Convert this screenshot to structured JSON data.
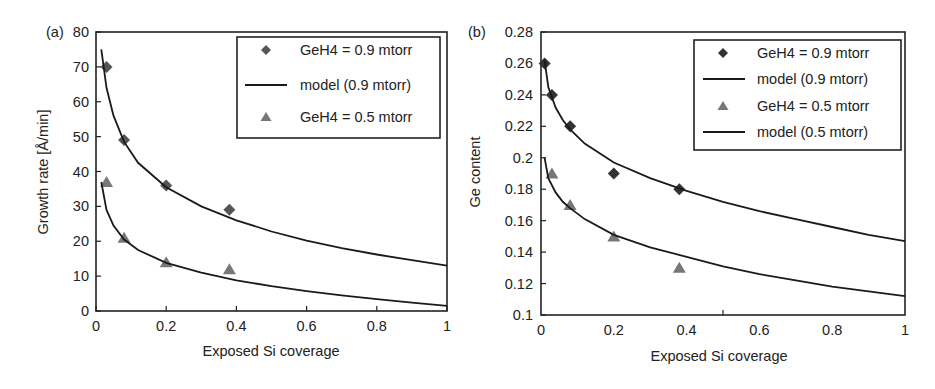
{
  "chart_data": [
    {
      "type": "scatter",
      "panel_label": "(a)",
      "title": "",
      "xlabel": "Exposed Si coverage",
      "ylabel": "Growth rate [Å/min]",
      "xlim": [
        0,
        1
      ],
      "ylim": [
        0,
        80
      ],
      "xticks": [
        0,
        0.2,
        0.4,
        0.6,
        0.8,
        1
      ],
      "xtick_labels": [
        "0",
        "0.2",
        "0.4",
        "0.6",
        "0.8",
        "1"
      ],
      "yticks": [
        0,
        10,
        20,
        30,
        40,
        50,
        60,
        70,
        80
      ],
      "ytick_labels": [
        "0",
        "10",
        "20",
        "30",
        "40",
        "50",
        "60",
        "70",
        "80"
      ],
      "grid": false,
      "legend_position": "top-right",
      "series": [
        {
          "name": "GeH4 = 0.9 mtorr",
          "kind": "points",
          "marker": "diamond",
          "color": "#555555",
          "x": [
            0.03,
            0.08,
            0.2,
            0.38
          ],
          "y": [
            70,
            49,
            36,
            29
          ]
        },
        {
          "name": "model (0.9 mtorr)",
          "kind": "line",
          "color": "#1a1a1a",
          "x": [
            0.015,
            0.03,
            0.05,
            0.08,
            0.12,
            0.2,
            0.3,
            0.4,
            0.5,
            0.6,
            0.7,
            0.8,
            0.9,
            1.0
          ],
          "y": [
            75,
            64,
            56,
            48.5,
            42.5,
            35.5,
            30,
            26,
            22.8,
            20.2,
            18,
            16.2,
            14.6,
            13
          ]
        },
        {
          "name": "GeH4 = 0.5 mtorr",
          "kind": "points",
          "marker": "triangle",
          "color": "#777777",
          "x": [
            0.03,
            0.08,
            0.2,
            0.38
          ],
          "y": [
            37,
            21,
            14,
            12
          ]
        },
        {
          "name": "model (0.5 mtorr)",
          "kind": "line",
          "color": "#1a1a1a",
          "in_legend": false,
          "x": [
            0.015,
            0.03,
            0.05,
            0.08,
            0.12,
            0.2,
            0.3,
            0.4,
            0.5,
            0.6,
            0.7,
            0.8,
            0.9,
            1.0
          ],
          "y": [
            37,
            29,
            24.5,
            20.5,
            17.5,
            13.8,
            11,
            8.8,
            7.1,
            5.7,
            4.5,
            3.4,
            2.4,
            1.5
          ]
        }
      ],
      "legend": [
        "GeH4 = 0.9 mtorr",
        "model (0.9 mtorr)",
        "GeH4 = 0.5 mtorr"
      ]
    },
    {
      "type": "scatter",
      "panel_label": "(b)",
      "title": "",
      "xlabel": "Exposed Si coverage",
      "ylabel": "Ge content",
      "xlim": [
        0,
        1
      ],
      "ylim": [
        0.1,
        0.28
      ],
      "xticks": [
        0,
        0.2,
        0.4,
        0.6,
        0.8,
        1
      ],
      "xtick_labels": [
        "0",
        "0.2",
        "0.4",
        "0.6",
        "0.8",
        "1"
      ],
      "yticks": [
        0.1,
        0.12,
        0.14,
        0.16,
        0.18,
        0.2,
        0.22,
        0.24,
        0.26,
        0.28
      ],
      "ytick_labels": [
        "0.1",
        "0.12",
        "0.14",
        "0.16",
        "0.18",
        "0.2",
        "0.22",
        "0.24",
        "0.26",
        "0.28"
      ],
      "grid": false,
      "legend_position": "top-right",
      "series": [
        {
          "name": "GeH4 = 0.9 mtorr",
          "kind": "points",
          "marker": "diamond",
          "color": "#333333",
          "x": [
            0.01,
            0.03,
            0.08,
            0.2,
            0.38
          ],
          "y": [
            0.26,
            0.24,
            0.22,
            0.19,
            0.18
          ]
        },
        {
          "name": "model (0.9 mtorr)",
          "kind": "line",
          "color": "#1a1a1a",
          "x": [
            0.01,
            0.02,
            0.04,
            0.06,
            0.08,
            0.12,
            0.2,
            0.3,
            0.4,
            0.5,
            0.6,
            0.7,
            0.8,
            0.9,
            1.0
          ],
          "y": [
            0.262,
            0.245,
            0.232,
            0.224,
            0.218,
            0.209,
            0.197,
            0.187,
            0.179,
            0.172,
            0.166,
            0.161,
            0.156,
            0.151,
            0.147
          ]
        },
        {
          "name": "GeH4 = 0.5 mtorr",
          "kind": "points",
          "marker": "triangle",
          "color": "#777777",
          "x": [
            0.03,
            0.08,
            0.2,
            0.38
          ],
          "y": [
            0.19,
            0.17,
            0.15,
            0.13
          ]
        },
        {
          "name": "model (0.5 mtorr)",
          "kind": "line",
          "color": "#1a1a1a",
          "x": [
            0.01,
            0.02,
            0.04,
            0.06,
            0.08,
            0.12,
            0.2,
            0.3,
            0.4,
            0.5,
            0.6,
            0.7,
            0.8,
            0.9,
            1.0
          ],
          "y": [
            0.2,
            0.187,
            0.178,
            0.172,
            0.168,
            0.161,
            0.151,
            0.143,
            0.137,
            0.131,
            0.126,
            0.122,
            0.118,
            0.115,
            0.112
          ]
        }
      ],
      "legend": [
        "GeH4 = 0.9 mtorr",
        "model (0.9 mtorr)",
        "GeH4 = 0.5 mtorr",
        "model (0.5 mtorr)"
      ]
    }
  ]
}
